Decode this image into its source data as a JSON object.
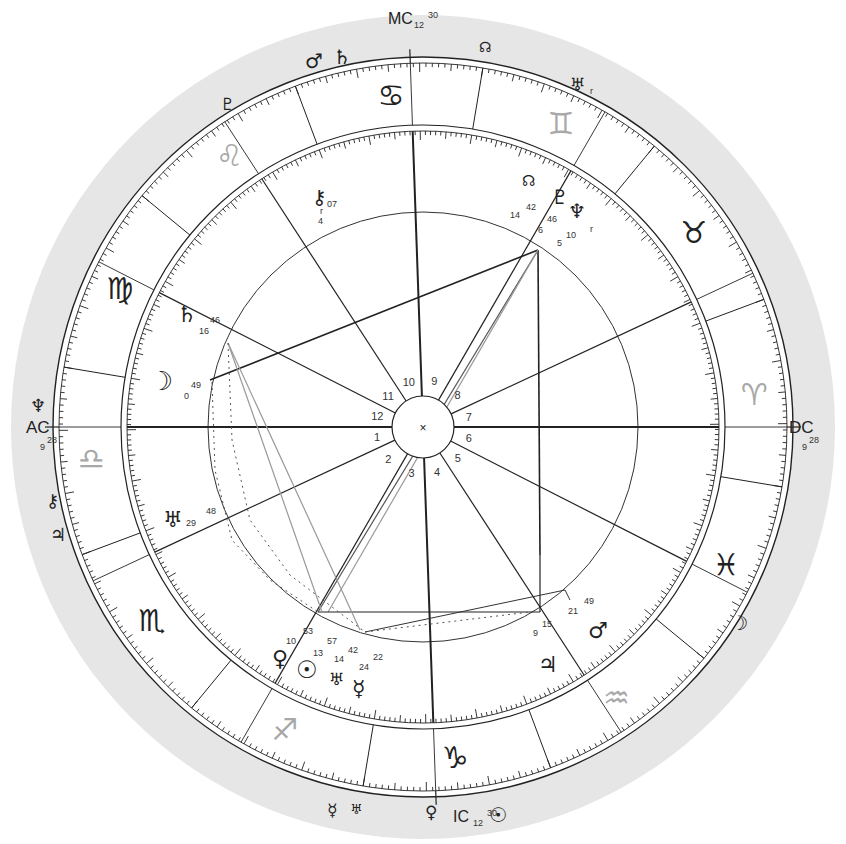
{
  "chart": {
    "colors": {
      "halo": "#e6e6e6",
      "line": "#222222",
      "aspect_light": "#9a9a9a",
      "sign_light": "#a8a8a8"
    },
    "angles": {
      "ac": {
        "label": "AC",
        "deg": "9",
        "min": "28"
      },
      "dc": {
        "label": "DC",
        "deg": "9",
        "min": "28"
      },
      "mc": {
        "label": "MC",
        "deg": "12",
        "min": "30"
      },
      "ic": {
        "label": "IC",
        "deg": "12",
        "min": "30"
      }
    },
    "center_mark": "×",
    "signs": [
      {
        "name": "cancer",
        "glyph": "♋",
        "light": false
      },
      {
        "name": "gemini",
        "glyph": "♊",
        "light": true
      },
      {
        "name": "taurus",
        "glyph": "♉",
        "light": false
      },
      {
        "name": "aries",
        "glyph": "♈",
        "light": true
      },
      {
        "name": "pisces",
        "glyph": "♓",
        "light": false
      },
      {
        "name": "aquarius",
        "glyph": "♒",
        "light": true
      },
      {
        "name": "capricorn",
        "glyph": "♑",
        "light": false
      },
      {
        "name": "sagittarius",
        "glyph": "♐",
        "light": true
      },
      {
        "name": "scorpio",
        "glyph": "♏",
        "light": false
      },
      {
        "name": "libra",
        "glyph": "♎",
        "light": true
      },
      {
        "name": "virgo",
        "glyph": "♍",
        "light": false
      },
      {
        "name": "leo",
        "glyph": "♌",
        "light": true
      }
    ],
    "houses": [
      "1",
      "2",
      "3",
      "4",
      "5",
      "6",
      "7",
      "8",
      "9",
      "10",
      "11",
      "12"
    ],
    "natal_planets": [
      {
        "name": "chiron",
        "glyph": "⚷",
        "deg": "4",
        "min": "07",
        "retro": "r"
      },
      {
        "name": "north-node",
        "glyph": "☊",
        "deg": "14",
        "min": "42"
      },
      {
        "name": "pluto",
        "glyph": "♇",
        "deg": "6",
        "min": "46"
      },
      {
        "name": "neptune",
        "glyph": "♆",
        "deg": "5",
        "min": "10",
        "retro": "r"
      },
      {
        "name": "saturn",
        "glyph": "♄",
        "deg": "16",
        "min": "46"
      },
      {
        "name": "moon",
        "glyph": "☽",
        "deg": "0",
        "min": "49"
      },
      {
        "name": "uranus",
        "glyph": "♅",
        "deg": "29",
        "min": "48"
      },
      {
        "name": "venus",
        "glyph": "♀",
        "deg": "10",
        "min": "53"
      },
      {
        "name": "sun",
        "glyph": "☉",
        "deg": "13",
        "min": "57"
      },
      {
        "name": "uranus-alt",
        "glyph": "♅",
        "deg": "14",
        "min": "42"
      },
      {
        "name": "mercury",
        "glyph": "☿",
        "deg": "24",
        "min": "22"
      },
      {
        "name": "mars",
        "glyph": "♂",
        "deg": "21",
        "min": "49"
      },
      {
        "name": "jupiter",
        "glyph": "♃",
        "deg": "9",
        "min": "15"
      }
    ],
    "transit_planets": [
      {
        "name": "transit-mars",
        "glyph": "♂"
      },
      {
        "name": "transit-saturn",
        "glyph": "♄"
      },
      {
        "name": "transit-pluto",
        "glyph": "♇"
      },
      {
        "name": "transit-north-node",
        "glyph": "☊"
      },
      {
        "name": "transit-uranus",
        "glyph": "♅",
        "retro": "r"
      },
      {
        "name": "transit-neptune",
        "glyph": "♆"
      },
      {
        "name": "transit-chiron",
        "glyph": "⚷"
      },
      {
        "name": "transit-jupiter",
        "glyph": "♃"
      },
      {
        "name": "transit-moon",
        "glyph": "☽"
      },
      {
        "name": "transit-mercury",
        "glyph": "☿"
      },
      {
        "name": "transit-uranus-2",
        "glyph": "♅"
      },
      {
        "name": "transit-venus",
        "glyph": "♀"
      },
      {
        "name": "transit-sun",
        "glyph": "☉"
      }
    ]
  }
}
